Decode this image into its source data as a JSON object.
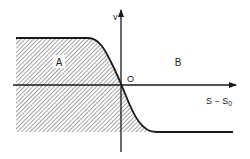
{
  "diagram": {
    "axes": {
      "vertical_label": "v",
      "horizontal_label": "S − S",
      "horizontal_label_subscript": "0",
      "origin_label": "O"
    },
    "regions": [
      {
        "label": "A",
        "hatched": true
      },
      {
        "label": "B",
        "hatched": false
      }
    ],
    "colors": {
      "line": "#1a1a1a",
      "hatch": "#555555",
      "background": "#ffffff"
    }
  }
}
